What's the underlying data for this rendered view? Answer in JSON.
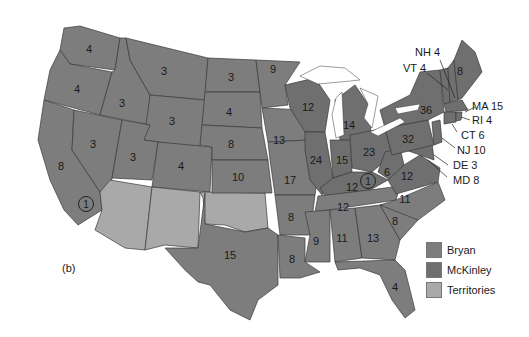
{
  "figure": {
    "panel_label": "(b)"
  },
  "colors": {
    "Bryan": "#7d7d7d",
    "McKinley": "#6f6f6f",
    "Territories": "#a9a9a9",
    "water": "#ffffff",
    "border": "#3a3a3a"
  },
  "legend": [
    {
      "label": "Bryan",
      "color": "#7d7d7d"
    },
    {
      "label": "McKinley",
      "color": "#6f6f6f"
    },
    {
      "label": "Territories",
      "color": "#a9a9a9"
    }
  ],
  "states": {
    "WA": {
      "votes": "4"
    },
    "OR": {
      "votes": "4"
    },
    "CA": {
      "votes": "8"
    },
    "CA_split": {
      "votes": "1"
    },
    "ID": {
      "votes": "3"
    },
    "NV": {
      "votes": "3"
    },
    "MT": {
      "votes": "3"
    },
    "WY": {
      "votes": "3"
    },
    "UT": {
      "votes": "3"
    },
    "CO": {
      "votes": "4"
    },
    "ND": {
      "votes": "3"
    },
    "SD": {
      "votes": "4"
    },
    "NE": {
      "votes": "8"
    },
    "KS": {
      "votes": "10"
    },
    "TX": {
      "votes": "15"
    },
    "MN": {
      "votes": "9"
    },
    "IA": {
      "votes": "13"
    },
    "MO": {
      "votes": "17"
    },
    "AR": {
      "votes": "8"
    },
    "LA": {
      "votes": "8"
    },
    "WI": {
      "votes": "12"
    },
    "IL": {
      "votes": "24"
    },
    "MI": {
      "votes": "14"
    },
    "IN": {
      "votes": "15"
    },
    "OH": {
      "votes": "23"
    },
    "KY": {
      "votes": "12"
    },
    "KY_split": {
      "votes": "1"
    },
    "TN": {
      "votes": "12"
    },
    "MS": {
      "votes": "9"
    },
    "AL": {
      "votes": "11"
    },
    "GA": {
      "votes": "13"
    },
    "FL": {
      "votes": "4"
    },
    "SC": {
      "votes": "8"
    },
    "NC": {
      "votes": "11"
    },
    "VA": {
      "votes": "12"
    },
    "WV": {
      "votes": "6"
    },
    "PA": {
      "votes": "32"
    },
    "NY": {
      "votes": "36"
    },
    "ME": {
      "votes": "8"
    }
  },
  "callouts": {
    "NH": "NH 4",
    "VT": "VT 4",
    "MA": "MA 15",
    "RI": "RI 4",
    "CT": "CT 6",
    "NJ": "NJ 10",
    "DE": "DE 3",
    "MD": "MD 8"
  }
}
